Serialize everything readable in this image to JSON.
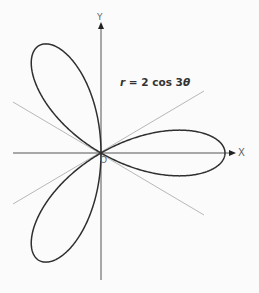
{
  "diagram": {
    "equation": {
      "r": "r",
      "eq": " = 2 cos 3",
      "theta": "θ"
    },
    "axes": {
      "x_label": "X",
      "y_label": "Y",
      "origin_label": "O"
    },
    "curve": {
      "type": "polar rose",
      "formula": "r = 2 cos 3θ",
      "amplitude": 2,
      "k": 3,
      "petals": 3
    },
    "guide_lines_degrees": [
      30,
      -30
    ],
    "colors": {
      "curve": "#2f2f2f",
      "axes": "#444444",
      "guides": "#b5b5b5",
      "background": "#fbfbfb"
    }
  }
}
